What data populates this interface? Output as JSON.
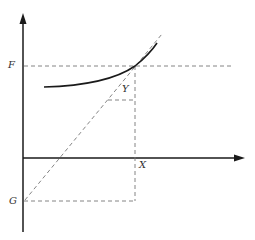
{
  "diagram": {
    "type": "function-graph-with-tangent",
    "labels": {
      "F": "F",
      "G": "G",
      "X": "X",
      "Y": "Y"
    },
    "colors": {
      "axis": "#1a1a1a",
      "curve": "#1a1a1a",
      "dashed": "#777777",
      "label": "#333333"
    },
    "elements": [
      "y-axis-with-arrow",
      "x-axis-with-arrow",
      "convex-curve",
      "tangent-line-dashed",
      "horizontal-guide-F-dashed",
      "vertical-guide-X-dashed",
      "horizontal-guide-G-dashed",
      "small-step-dashed-Y"
    ]
  }
}
